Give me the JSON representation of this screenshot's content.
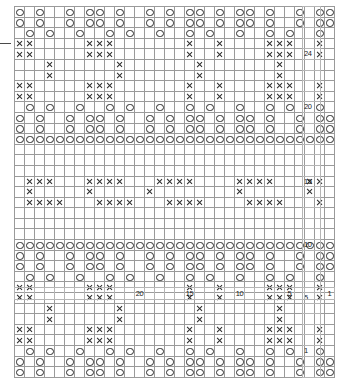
{
  "chart_data": {
    "type": "table",
    "title": "",
    "xlabel": "",
    "ylabel": "",
    "columns": 32,
    "rows": 28,
    "grid_on": true,
    "legend_position": "none",
    "symbols": {
      "o": "yarn-over-circle",
      "x": "cross-stitch",
      "g": "gray-filled",
      "l": "light-gray-filled",
      "b": "blank"
    },
    "colors": {
      "gray": "#a8a8a8",
      "light_gray": "#c9c9c9",
      "blank": "#ffffff",
      "symbol": "#2a2a2a",
      "gridline": "#9a9a9a"
    },
    "row_tick_labels": [
      "24",
      "20",
      "15",
      "10",
      "5",
      "1"
    ],
    "row_tick_positions": [
      24,
      20,
      15,
      10,
      5,
      1
    ],
    "column_tick_labels": [
      "20",
      "15",
      "10",
      "5",
      "1"
    ],
    "column_tick_positions": [
      20,
      15,
      10,
      5,
      1
    ],
    "cells": [
      "obobboboobobbobobooboboobobboboo",
      "obobboboobobbobobooboboobobboboo",
      "bobobbobbobobbobbobobbobbobobbob",
      "xxbgggbxxxbgggggbxgbxgggbxxxbgxg",
      "xxbgggbxxxbgggggbxgbxgggbxxxbgxg",
      "ggbxbggggbxbgggggbxbgggbgbxbgggg",
      "ggbxbggggbxbgggggbxbgggbgbxbgggg",
      "xxbgggbxxxbgggggbxgbxgggbxxxbgxg",
      "xxbgggbxxxbgggggbxgbxgggbxxxbgxg",
      "bobobbobbobobbobbobobbobbobobbob",
      "obobboboobobbobobooboboobobboboo",
      "obobboboobobbobobooboboobobboboo",
      "oooooooooooooooooooooooooooooooo",
      "gggggggggggggggggggggggggggggggg",
      "gggggggggggggggggggggggggggggggg",
      "llllllllllllllllllllllllllllllll",
      "lxxxlllxxxxlllxxxxllllxxxxlllxxl",
      "lxlllllxlllllxllllllllxllllllxll",
      "lxxxxlllxxxxlllxxxxllllxxxxlllxl",
      "llllllllllllllllllllllllllllllll",
      "gggggggggggggggggggggggggggggggg",
      "gggggggggggggggggggggggggggggggg",
      "oooooooooooooooooooooooooooooooo",
      "obobboboobobbobobooboboobobboboo",
      "obobboboobobbobobooboboobobboboo",
      "bobobbobbobobbobbobobbobbobobbob",
      "xxbgggbxxxbgggggbxgbxgggbxxxbgxg",
      "xxbgggbxxxbgggggbxgbxgggbxxxbgxg",
      "ggbxbggggbxbgggggbxbgggbgbxbgggg",
      "ggbxbggggbxbgggggbxbgggbgbxbgggg",
      "xxbgggbxxxbgggggbxgbxgggbxxxbgxg",
      "xxbgggbxxxbgggggbxgbxgggbxxxbgxg",
      "bobobbobbobobbobbobobbobbobobbob",
      "obobboboobobbobobooboboobobboboo",
      "obobboboobobbobobooboboobobboboo"
    ]
  },
  "axes": {
    "row_labels": [
      {
        "value": "24",
        "row_index": 4
      },
      {
        "value": "20",
        "row_index": 9
      },
      {
        "value": "15",
        "row_index": 16
      },
      {
        "value": "10",
        "row_index": 22
      },
      {
        "value": "5",
        "row_index": 27
      },
      {
        "value": "1",
        "row_index": 32
      }
    ],
    "column_labels": [
      {
        "value": "20",
        "col_index": 12
      },
      {
        "value": "15",
        "col_index": 17
      },
      {
        "value": "10",
        "col_index": 22
      },
      {
        "value": "5",
        "col_index": 27
      },
      {
        "value": "1",
        "col_index": 31
      }
    ]
  }
}
